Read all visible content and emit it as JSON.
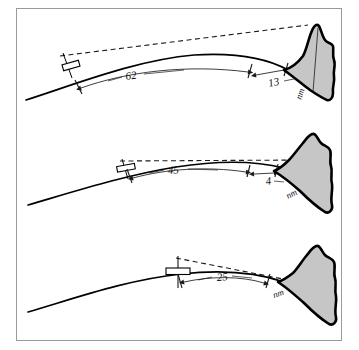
{
  "figure": {
    "unit_label": "nm",
    "colors": {
      "mountain_fill": "#c6c6c6",
      "mountain_outline": "#000000",
      "ink": "#111111",
      "frame": "#9a9a9a",
      "background": "#ffffff"
    }
  },
  "panels": [
    {
      "id": "panel-top",
      "name": "high-observer-panel",
      "distance_to_horizon": "62",
      "distance_from_horizon_to_peak": "13",
      "unit": "nm"
    },
    {
      "id": "panel-middle",
      "name": "mid-observer-panel",
      "distance_to_horizon": "45",
      "distance_from_horizon_to_peak": "4",
      "unit": "nm"
    },
    {
      "id": "panel-bottom",
      "name": "low-observer-panel",
      "distance_to_horizon": "25",
      "distance_from_horizon_to_peak": "",
      "unit": "nm"
    }
  ]
}
